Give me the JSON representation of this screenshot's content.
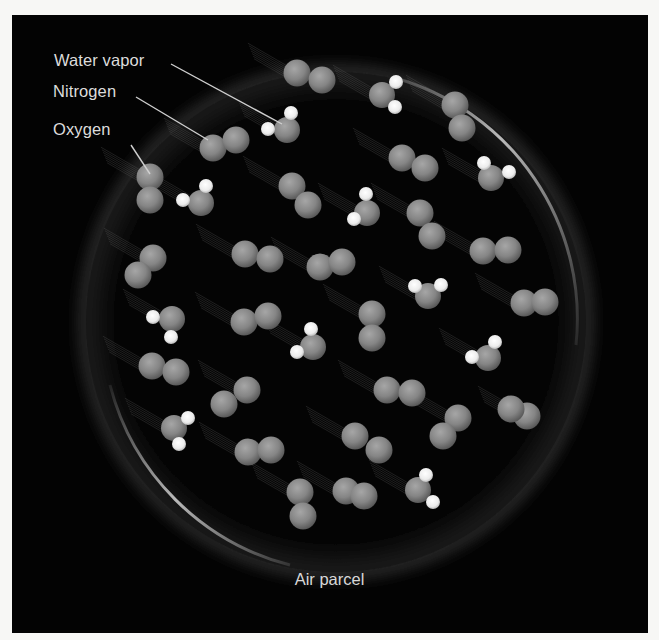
{
  "figure": {
    "caption": "Air parcel",
    "labels": {
      "water_vapor": "Water vapor",
      "nitrogen": "Nitrogen",
      "oxygen": "Oxygen"
    },
    "colors": {
      "background": "#030303",
      "page": "#f7f7f5",
      "atom": "#8a8a8a",
      "hydrogen": "#f2f2f2",
      "parcel_rim": "#bdbdbd",
      "text": "#dcdcdc"
    }
  },
  "molecules": {
    "diatomic": [
      [
        [
          297,
          73
        ],
        [
          322,
          80
        ]
      ],
      [
        [
          455,
          105
        ],
        [
          462,
          128
        ]
      ],
      [
        [
          213,
          148
        ],
        [
          236,
          140
        ]
      ],
      [
        [
          150,
          177
        ],
        [
          150,
          200
        ]
      ],
      [
        [
          402,
          158
        ],
        [
          425,
          168
        ]
      ],
      [
        [
          292,
          186
        ],
        [
          308,
          205
        ]
      ],
      [
        [
          420,
          213
        ],
        [
          432,
          236
        ]
      ],
      [
        [
          483,
          251
        ],
        [
          508,
          250
        ]
      ],
      [
        [
          153,
          258
        ],
        [
          138,
          275
        ]
      ],
      [
        [
          245,
          254
        ],
        [
          270,
          259
        ]
      ],
      [
        [
          320,
          267
        ],
        [
          342,
          262
        ]
      ],
      [
        [
          524,
          303
        ],
        [
          545,
          302
        ]
      ],
      [
        [
          244,
          322
        ],
        [
          268,
          316
        ]
      ],
      [
        [
          372,
          314
        ],
        [
          372,
          338
        ]
      ],
      [
        [
          152,
          366
        ],
        [
          176,
          372
        ]
      ],
      [
        [
          247,
          390
        ],
        [
          224,
          404
        ]
      ],
      [
        [
          387,
          390
        ],
        [
          412,
          393
        ]
      ],
      [
        [
          458,
          418
        ],
        [
          443,
          436
        ]
      ],
      [
        [
          527,
          416
        ],
        [
          511,
          409
        ]
      ],
      [
        [
          355,
          436
        ],
        [
          379,
          450
        ]
      ],
      [
        [
          248,
          452
        ],
        [
          271,
          450
        ]
      ],
      [
        [
          300,
          492
        ],
        [
          303,
          516
        ]
      ],
      [
        [
          346,
          491
        ],
        [
          364,
          496
        ]
      ]
    ],
    "water": [
      {
        "o": [
          382,
          95
        ],
        "h": [
          [
            396,
            82
          ],
          [
            395,
            107
          ]
        ]
      },
      {
        "o": [
          287,
          130
        ],
        "h": [
          [
            291,
            113
          ],
          [
            268,
            129
          ]
        ]
      },
      {
        "o": [
          201,
          203
        ],
        "h": [
          [
            206,
            186
          ],
          [
            183,
            200
          ]
        ]
      },
      {
        "o": [
          491,
          178
        ],
        "h": [
          [
            484,
            163
          ],
          [
            509,
            172
          ]
        ]
      },
      {
        "o": [
          367,
          213
        ],
        "h": [
          [
            366,
            194
          ],
          [
            354,
            219
          ]
        ]
      },
      {
        "o": [
          428,
          296
        ],
        "h": [
          [
            415,
            286
          ],
          [
            441,
            285
          ]
        ]
      },
      {
        "o": [
          172,
          319
        ],
        "h": [
          [
            153,
            317
          ],
          [
            171,
            337
          ]
        ]
      },
      {
        "o": [
          313,
          347
        ],
        "h": [
          [
            311,
            329
          ],
          [
            297,
            352
          ]
        ]
      },
      {
        "o": [
          488,
          358
        ],
        "h": [
          [
            495,
            342
          ],
          [
            472,
            357
          ]
        ]
      },
      {
        "o": [
          174,
          428
        ],
        "h": [
          [
            188,
            418
          ],
          [
            179,
            444
          ]
        ]
      },
      {
        "o": [
          418,
          490
        ],
        "h": [
          [
            426,
            475
          ],
          [
            433,
            502
          ]
        ]
      }
    ]
  }
}
